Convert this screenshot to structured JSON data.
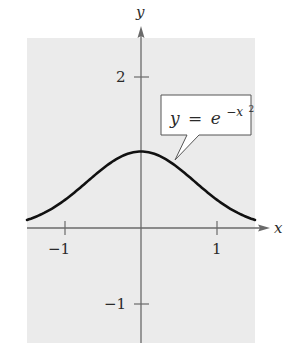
{
  "chart_data": {
    "type": "line",
    "title": "",
    "xlabel": "x",
    "ylabel": "y",
    "xlim": [
      -1.5,
      1.5
    ],
    "ylim": [
      -1.5,
      2.5
    ],
    "grid": false,
    "background": "#ebebeb",
    "x_ticks": [
      -1,
      1
    ],
    "y_ticks": [
      2,
      -1
    ],
    "x_tick_labels": [
      "−1",
      "1"
    ],
    "y_tick_labels": [
      "2",
      "−1"
    ],
    "series": [
      {
        "name": "y = e^(-x^2)",
        "function": "exp(-x^2)",
        "color": "#111111",
        "x": [
          -1.5,
          -1.25,
          -1.0,
          -0.75,
          -0.5,
          -0.25,
          0,
          0.25,
          0.5,
          0.75,
          1.0,
          1.25,
          1.5
        ],
        "values": [
          0.105,
          0.21,
          0.368,
          0.57,
          0.779,
          0.939,
          1.0,
          0.939,
          0.779,
          0.57,
          0.368,
          0.21,
          0.105
        ]
      }
    ],
    "annotations": [
      {
        "text_main": "y = e",
        "text_exp": "−x",
        "text_exp2": "2",
        "points_to": [
          0.45,
          0.82
        ]
      }
    ]
  },
  "labels": {
    "x_axis": "x",
    "y_axis": "y",
    "xtick_neg1": "−1",
    "xtick_pos1": "1",
    "ytick_2": "2",
    "ytick_neg1": "−1",
    "callout_y": "y",
    "callout_eq": "=",
    "callout_e": "e",
    "callout_exp": "−x",
    "callout_exp2": "2"
  }
}
